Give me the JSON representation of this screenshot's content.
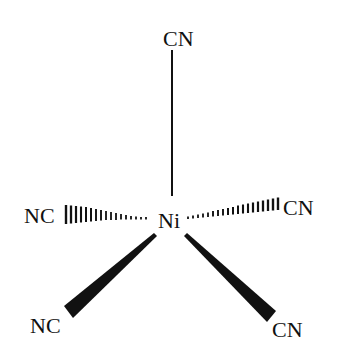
{
  "diagram": {
    "center_atom": "Ni",
    "ligands": {
      "apical": "CN",
      "left_hashed": "NC",
      "right_hashed": "CN",
      "left_wedge": "NC",
      "right_wedge": "CN"
    },
    "colors": {
      "ink": "#111111",
      "background": "#ffffff"
    }
  }
}
